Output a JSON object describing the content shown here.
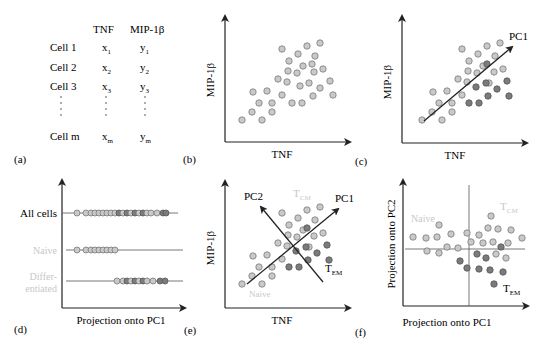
{
  "colors": {
    "light_point": "#c9c9c9",
    "light_stroke": "#7a7a7a",
    "dark_point": "#7b7b7b",
    "dark_stroke": "#555555",
    "axis": "#222222",
    "faded_text": "#c8c8c8"
  },
  "panel_a": {
    "label": "(a)",
    "headers": [
      "TNF",
      "MIP-1β"
    ],
    "rows": [
      {
        "cell": "Cell 1",
        "x": "x",
        "xs": "1",
        "y": "y",
        "ys": "1"
      },
      {
        "cell": "Cell 2",
        "x": "x",
        "xs": "2",
        "y": "y",
        "ys": "2"
      },
      {
        "cell": "Cell 3",
        "x": "x",
        "xs": "3",
        "y": "y",
        "ys": "3"
      },
      {
        "cell": "Cell m",
        "x": "x",
        "xs": "m",
        "y": "y",
        "ys": "m"
      }
    ]
  },
  "panel_b": {
    "label": "(b)",
    "xlabel": "TNF",
    "ylabel": "MIP-1β"
  },
  "panel_c": {
    "label": "(c)",
    "xlabel": "TNF",
    "ylabel": "MIP-1β",
    "arrow_label": "PC1"
  },
  "panel_d": {
    "label": "(d)",
    "xlabel": "Projection onto PC1",
    "rows": [
      "All cells",
      "Naive",
      "Differ-",
      "entiated"
    ]
  },
  "panel_e": {
    "label": "(e)",
    "xlabel": "TNF",
    "ylabel": "MIP-1β",
    "pc1": "PC1",
    "pc2": "PC2",
    "tcm": "T",
    "tcm_sub": "CM",
    "tem": "T",
    "tem_sub": "EM",
    "naive": "Naive"
  },
  "panel_f": {
    "label": "(f)",
    "xlabel": "Projection onto PC1",
    "ylabel": "Projection onto PC2",
    "naive": "Naive",
    "tcm": "T",
    "tcm_sub": "CM",
    "tem": "T",
    "tem_sub": "EM"
  },
  "chart_data": {
    "type": "scatter",
    "title": "",
    "panels": [
      {
        "id": "b",
        "xlabel": "TNF",
        "ylabel": "MIP-1β",
        "series": [
          {
            "name": "cells",
            "shade": "light",
            "points": [
              [
                282,
                49
              ],
              [
                307,
                46
              ],
              [
                320,
                43
              ],
              [
                298,
                54
              ],
              [
                315,
                56
              ],
              [
                289,
                61
              ],
              [
                303,
                66
              ],
              [
                312,
                64
              ],
              [
                288,
                71
              ],
              [
                297,
                73
              ],
              [
                314,
                72
              ],
              [
                323,
                69
              ],
              [
                278,
                79
              ],
              [
                287,
                82
              ],
              [
                300,
                86
              ],
              [
                309,
                83
              ],
              [
                330,
                81
              ],
              [
                253,
                92
              ],
              [
                267,
                91
              ],
              [
                282,
                95
              ],
              [
                320,
                88
              ],
              [
                313,
                96
              ],
              [
                333,
                95
              ],
              [
                259,
                103
              ],
              [
                272,
                103
              ],
              [
                292,
                103
              ],
              [
                302,
                103
              ],
              [
                252,
                112
              ],
              [
                272,
                112
              ],
              [
                242,
                120
              ],
              [
                262,
                120
              ]
            ]
          }
        ]
      },
      {
        "id": "c",
        "xlabel": "TNF",
        "ylabel": "MIP-1β",
        "arrow": "PC1",
        "series": [
          {
            "name": "naive-like",
            "shade": "light",
            "points": [
              [
                462,
                49
              ],
              [
                487,
                46
              ],
              [
                500,
                43
              ],
              [
                478,
                54
              ],
              [
                495,
                56
              ],
              [
                469,
                61
              ],
              [
                483,
                66
              ],
              [
                468,
                71
              ],
              [
                477,
                73
              ],
              [
                494,
                72
              ],
              [
                503,
                69
              ],
              [
                458,
                79
              ],
              [
                467,
                82
              ],
              [
                489,
                83
              ],
              [
                433,
                92
              ],
              [
                447,
                91
              ],
              [
                462,
                95
              ],
              [
                439,
                103
              ],
              [
                452,
                103
              ],
              [
                432,
                112
              ],
              [
                452,
                112
              ],
              [
                422,
                120
              ],
              [
                442,
                120
              ]
            ]
          },
          {
            "name": "differentiated",
            "shade": "dark",
            "points": [
              [
                487,
                64
              ],
              [
                476,
                87
              ],
              [
                486,
                83
              ],
              [
                507,
                81
              ],
              [
                497,
                89
              ],
              [
                488,
                96
              ],
              [
                509,
                96
              ],
              [
                469,
                103
              ],
              [
                479,
                103
              ]
            ]
          }
        ]
      },
      {
        "id": "d",
        "xlabel": "Projection onto PC1",
        "rows": [
          "All cells",
          "Naive",
          "Differentiated"
        ]
      },
      {
        "id": "e",
        "xlabel": "TNF",
        "ylabel": "MIP-1β",
        "arrows": [
          "PC1",
          "PC2"
        ],
        "annotations": [
          "TCM",
          "TEM",
          "Naive"
        ]
      },
      {
        "id": "f",
        "xlabel": "Projection onto PC1",
        "ylabel": "Projection onto PC2",
        "annotations": [
          "Naive",
          "TCM",
          "TEM"
        ],
        "series": [
          {
            "name": "light",
            "shade": "light",
            "points": [
              [
                413,
                237
              ],
              [
                426,
                238
              ],
              [
                437,
                237
              ],
              [
                439,
                225
              ],
              [
                451,
                234
              ],
              [
                467,
                233
              ],
              [
                479,
                235
              ],
              [
                491,
                216
              ],
              [
                488,
                228
              ],
              [
                498,
                229
              ],
              [
                511,
                230
              ],
              [
                522,
                238
              ],
              [
                471,
                242
              ],
              [
                483,
                243
              ],
              [
                493,
                242
              ],
              [
                508,
                243
              ],
              [
                447,
                247
              ],
              [
                458,
                248
              ],
              [
                427,
                251
              ],
              [
                439,
                253
              ],
              [
                496,
                254
              ],
              [
                506,
                258
              ]
            ]
          },
          {
            "name": "dark",
            "shade": "dark",
            "points": [
              [
                501,
                247
              ],
              [
                477,
                254
              ],
              [
                486,
                258
              ],
              [
                460,
                261
              ],
              [
                467,
                268
              ],
              [
                479,
                269
              ],
              [
                490,
                270
              ],
              [
                503,
                272
              ],
              [
                494,
                284
              ]
            ]
          }
        ]
      }
    ]
  }
}
